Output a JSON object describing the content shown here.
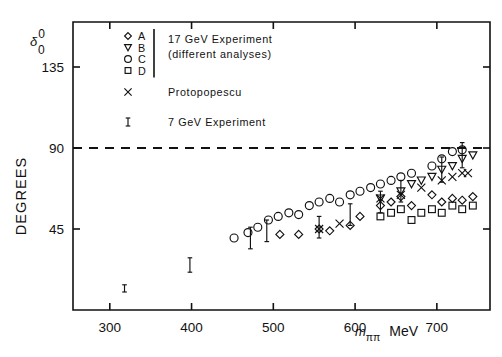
{
  "chart_data": {
    "type": "scatter",
    "title": "",
    "xlabel": "m_pipi  MeV",
    "ylabel": "DEGREES",
    "y_axis_symbol": "delta_0^0",
    "xlim": [
      255,
      765
    ],
    "ylim": [
      0,
      160
    ],
    "xticks": [
      300,
      400,
      500,
      600,
      700
    ],
    "yticks": [
      45,
      90,
      135
    ],
    "xtick_labels": [
      "300",
      "400",
      "500",
      "600",
      "700"
    ],
    "ytick_labels": [
      "45",
      "90",
      "135"
    ],
    "grid": false,
    "annotations": [
      {
        "type": "hline",
        "y": 90,
        "style": "dashed",
        "label": "90 degrees"
      }
    ],
    "legend_position": "upper-left-inside",
    "series": [
      {
        "name": "A",
        "marker": "diamond",
        "group": "17 GeV Experiment",
        "points": [
          {
            "x": 508,
            "y": 42
          },
          {
            "x": 531,
            "y": 42
          },
          {
            "x": 556,
            "y": 45
          },
          {
            "x": 569,
            "y": 44
          },
          {
            "x": 594,
            "y": 47
          },
          {
            "x": 606,
            "y": 52
          },
          {
            "x": 631,
            "y": 58
          },
          {
            "x": 644,
            "y": 60
          },
          {
            "x": 656,
            "y": 63
          },
          {
            "x": 669,
            "y": 58
          },
          {
            "x": 694,
            "y": 64
          },
          {
            "x": 706,
            "y": 60
          },
          {
            "x": 719,
            "y": 62
          },
          {
            "x": 731,
            "y": 61
          },
          {
            "x": 744,
            "y": 63
          }
        ]
      },
      {
        "name": "B",
        "marker": "triangle-down",
        "group": "17 GeV Experiment",
        "points": [
          {
            "x": 631,
            "y": 62
          },
          {
            "x": 656,
            "y": 66
          },
          {
            "x": 669,
            "y": 70
          },
          {
            "x": 681,
            "y": 72
          },
          {
            "x": 694,
            "y": 74
          },
          {
            "x": 706,
            "y": 78
          },
          {
            "x": 719,
            "y": 80
          },
          {
            "x": 731,
            "y": 84
          },
          {
            "x": 744,
            "y": 86
          }
        ]
      },
      {
        "name": "C",
        "marker": "circle",
        "group": "17 GeV Experiment",
        "points": [
          {
            "x": 452,
            "y": 40
          },
          {
            "x": 469,
            "y": 43
          },
          {
            "x": 481,
            "y": 46
          },
          {
            "x": 494,
            "y": 50
          },
          {
            "x": 506,
            "y": 52
          },
          {
            "x": 519,
            "y": 54
          },
          {
            "x": 531,
            "y": 53
          },
          {
            "x": 544,
            "y": 58
          },
          {
            "x": 556,
            "y": 60
          },
          {
            "x": 569,
            "y": 62
          },
          {
            "x": 581,
            "y": 60
          },
          {
            "x": 594,
            "y": 64
          },
          {
            "x": 606,
            "y": 66
          },
          {
            "x": 619,
            "y": 68
          },
          {
            "x": 631,
            "y": 70
          },
          {
            "x": 644,
            "y": 72
          },
          {
            "x": 656,
            "y": 74
          },
          {
            "x": 669,
            "y": 76
          },
          {
            "x": 694,
            "y": 80
          },
          {
            "x": 706,
            "y": 84
          },
          {
            "x": 719,
            "y": 88
          },
          {
            "x": 731,
            "y": 89
          }
        ]
      },
      {
        "name": "D",
        "marker": "square",
        "group": "17 GeV Experiment",
        "points": [
          {
            "x": 631,
            "y": 52
          },
          {
            "x": 644,
            "y": 54
          },
          {
            "x": 656,
            "y": 56
          },
          {
            "x": 669,
            "y": 50
          },
          {
            "x": 681,
            "y": 54
          },
          {
            "x": 694,
            "y": 56
          },
          {
            "x": 706,
            "y": 54
          },
          {
            "x": 719,
            "y": 58
          },
          {
            "x": 731,
            "y": 56
          },
          {
            "x": 744,
            "y": 58
          }
        ]
      },
      {
        "name": "Protopopescu",
        "marker": "cross-x",
        "group": "Protopopescu",
        "points": [
          {
            "x": 556,
            "y": 45
          },
          {
            "x": 581,
            "y": 48
          },
          {
            "x": 631,
            "y": 62
          },
          {
            "x": 656,
            "y": 64
          },
          {
            "x": 681,
            "y": 68
          },
          {
            "x": 706,
            "y": 72
          },
          {
            "x": 719,
            "y": 74
          },
          {
            "x": 731,
            "y": 76
          },
          {
            "x": 738,
            "y": 76
          }
        ]
      },
      {
        "name": "7 GeV Experiment",
        "marker": "errorbar",
        "group": "7 GeV Experiment",
        "points": [
          {
            "x": 318,
            "y": 12,
            "yerr": 2
          },
          {
            "x": 398,
            "y": 25,
            "yerr": 4
          },
          {
            "x": 472,
            "y": 40,
            "yerr": 6
          },
          {
            "x": 492,
            "y": 44,
            "yerr": 6
          },
          {
            "x": 556,
            "y": 46,
            "yerr": 6
          },
          {
            "x": 594,
            "y": 53,
            "yerr": 6
          },
          {
            "x": 631,
            "y": 60,
            "yerr": 6
          },
          {
            "x": 656,
            "y": 66,
            "yerr": 6
          },
          {
            "x": 706,
            "y": 78,
            "yerr": 7
          },
          {
            "x": 731,
            "y": 86,
            "yerr": 7
          }
        ]
      }
    ]
  },
  "legend": {
    "rows": [
      {
        "symbol": "diamond",
        "key": "A"
      },
      {
        "symbol": "triangle-down",
        "key": "B"
      },
      {
        "symbol": "circle",
        "key": "C"
      },
      {
        "symbol": "square",
        "key": "D"
      }
    ],
    "group_label_line1": "17 GeV  Experiment",
    "group_label_line2": "(different  analyses)",
    "protopopescu_symbol": "cross-x",
    "protopopescu_label": "Protopopescu",
    "sevengev_symbol": "errorbar",
    "sevengev_label": "7 GeV  Experiment"
  },
  "axes": {
    "y_symbol_base": "δ",
    "y_symbol_sup": "0",
    "y_symbol_sub": "0",
    "y_title": "DEGREES",
    "x_title_m": "m",
    "x_title_sub": "ππ",
    "x_title_unit": "MeV",
    "ytick_135": "135",
    "ytick_90": "90",
    "ytick_45": "45",
    "xtick_300": "300",
    "xtick_400": "400",
    "xtick_500": "500",
    "xtick_600": "600",
    "xtick_700": "700"
  },
  "colors": {
    "ink": "#111111",
    "background": "#ffffff"
  }
}
